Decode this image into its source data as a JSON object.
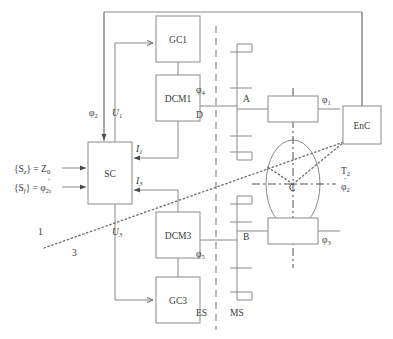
{
  "diagram": {
    "blocks": [
      {
        "id": "gc1",
        "label": "GC1",
        "x": 156,
        "y": 16,
        "w": 44,
        "h": 46
      },
      {
        "id": "dcm1",
        "label": "DCM1",
        "x": 156,
        "y": 75,
        "w": 44,
        "h": 46
      },
      {
        "id": "sc",
        "label": "SC",
        "x": 88,
        "y": 142,
        "w": 44,
        "h": 62
      },
      {
        "id": "dcm3",
        "label": "DCM3",
        "x": 156,
        "y": 212,
        "w": 44,
        "h": 46
      },
      {
        "id": "gc3",
        "label": "GC3",
        "x": 156,
        "y": 277,
        "w": 44,
        "h": 46
      },
      {
        "id": "enc",
        "label": "EnC",
        "x": 343,
        "y": 106,
        "w": 38,
        "h": 38
      },
      {
        "id": "actA",
        "label": "",
        "x": 268,
        "y": 96,
        "w": 50,
        "h": 26
      },
      {
        "id": "actB",
        "label": "",
        "x": 268,
        "y": 218,
        "w": 50,
        "h": 26
      }
    ],
    "signal_labels": [
      {
        "id": "phi2",
        "base": "φ",
        "sub": "2",
        "x": 89,
        "y": 116,
        "italic": false,
        "dot": false
      },
      {
        "id": "u1",
        "base": "U",
        "sub": "1",
        "x": 112,
        "y": 116,
        "italic": true,
        "dot": false
      },
      {
        "id": "u3",
        "base": "U",
        "sub": "3",
        "x": 112,
        "y": 235,
        "italic": true,
        "dot": false
      },
      {
        "id": "i1",
        "base": "I",
        "sub": "1",
        "x": 136,
        "y": 152,
        "italic": true,
        "dot": false
      },
      {
        "id": "i3",
        "base": "I",
        "sub": "3",
        "x": 136,
        "y": 184,
        "italic": true,
        "dot": false
      },
      {
        "id": "phi4",
        "base": "φ",
        "sub": "4",
        "x": 196,
        "y": 93,
        "italic": false,
        "dot": false
      },
      {
        "id": "phi5",
        "base": "φ",
        "sub": "5",
        "x": 196,
        "y": 257,
        "italic": false,
        "dot": false
      },
      {
        "id": "phi1",
        "base": "φ",
        "sub": "1",
        "x": 322,
        "y": 103,
        "italic": false,
        "dot": false
      },
      {
        "id": "phi3",
        "base": "φ",
        "sub": "3",
        "x": 322,
        "y": 243,
        "italic": false,
        "dot": false
      },
      {
        "id": "phi2d",
        "base": "φ",
        "sub": "2",
        "x": 341,
        "y": 190,
        "italic": false,
        "dot": true
      },
      {
        "id": "t2",
        "base": "T",
        "sub": "2",
        "x": 341,
        "y": 174,
        "italic": false,
        "dot": false
      }
    ],
    "input_labels": [
      {
        "id": "input-sz",
        "text": "{S",
        "sub1": "z",
        "mid": "} = Z",
        "sub2": "0",
        "dot": false,
        "x": 14,
        "y": 168
      },
      {
        "id": "input-sf",
        "text": "{S",
        "sub1": "f",
        "mid": "} = φ",
        "sub2": "2r",
        "dot": true,
        "x": 14,
        "y": 187
      }
    ],
    "plain_labels": [
      {
        "id": "label-d",
        "text": "D",
        "x": 196,
        "y": 118
      },
      {
        "id": "label-a",
        "text": "A",
        "x": 243,
        "y": 102
      },
      {
        "id": "label-b",
        "text": "B",
        "x": 243,
        "y": 240
      },
      {
        "id": "label-c",
        "text": "C",
        "x": 289,
        "y": 191
      },
      {
        "id": "label-es",
        "text": "ES",
        "x": 196,
        "y": 316
      },
      {
        "id": "label-ms",
        "text": "MS",
        "x": 230,
        "y": 316
      },
      {
        "id": "label-1",
        "text": "1",
        "x": 38,
        "y": 235
      },
      {
        "id": "label-3",
        "text": "3",
        "x": 72,
        "y": 256
      }
    ],
    "rotor": {
      "cx": 293,
      "cy": 184,
      "rx": 27,
      "ry": 44
    },
    "separator": {
      "x": 216,
      "y1": 26,
      "y2": 330,
      "name": "es-ms-divider"
    },
    "colors": {
      "line": "#8a8a8a",
      "text": "#3a3a3a",
      "background": "#ffffff",
      "axis": "#4a4a4a"
    }
  }
}
